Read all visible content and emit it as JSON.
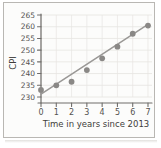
{
  "chart_data": {
    "type": "scatter",
    "title": "",
    "xlabel": "Time in years since 2013",
    "ylabel": "CPI",
    "x": [
      0,
      1,
      2,
      3,
      4,
      5,
      6,
      7
    ],
    "values": [
      233,
      235,
      236.5,
      241.5,
      246.5,
      251.5,
      257,
      260.5
    ],
    "xticks": [
      "0",
      "1",
      "2",
      "3",
      "4",
      "5",
      "6",
      "7"
    ],
    "yticks": [
      "230",
      "235",
      "240",
      "245",
      "250",
      "255",
      "260",
      "265"
    ],
    "xlim": [
      0,
      7
    ],
    "ylim": [
      230,
      265
    ],
    "grid": true,
    "trendline": {
      "label": "line of best fit",
      "x_start": 0,
      "y_start": 231.2,
      "x_end": 7,
      "y_end": 261.0
    },
    "marker_color": "#8a8886",
    "line_color": "#9a9896",
    "grid_color": "#e6e4e1",
    "axis_color": "#6f6d6b"
  },
  "labels": {
    "y_axis_title": "CPI",
    "x_axis_title": "Time in years since 2013"
  }
}
